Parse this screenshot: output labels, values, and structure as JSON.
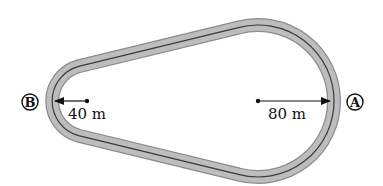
{
  "diagram": {
    "type": "race-track",
    "points": [
      {
        "id": "B",
        "label": "B",
        "radius_label": "40 m"
      },
      {
        "id": "A",
        "label": "A",
        "radius_label": "80 m"
      }
    ],
    "colors": {
      "track_fill": "#b4b4b4",
      "track_edge": "#8a8a8a",
      "center_line": "#3a3a3a",
      "arrow": "#111111",
      "background": "#ffffff"
    }
  }
}
